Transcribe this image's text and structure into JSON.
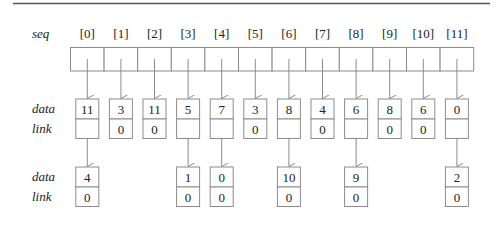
{
  "diagram": {
    "seq_label": "seq",
    "data_label": "data",
    "link_label": "link",
    "indices": [
      "[0]",
      "[1]",
      "[2]",
      "[3]",
      "[4]",
      "[5]",
      "[6]",
      "[7]",
      "[8]",
      "[9]",
      "[10]",
      "[11]"
    ],
    "first_nodes": [
      {
        "data": "11",
        "link": "",
        "has_next": true
      },
      {
        "data": "3",
        "link": "0",
        "has_next": false
      },
      {
        "data": "11",
        "link": "0",
        "has_next": false
      },
      {
        "data": "5",
        "link": "",
        "has_next": true
      },
      {
        "data": "7",
        "link": "",
        "has_next": true
      },
      {
        "data": "3",
        "link": "0",
        "has_next": false
      },
      {
        "data": "8",
        "link": "",
        "has_next": true
      },
      {
        "data": "4",
        "link": "0",
        "has_next": false
      },
      {
        "data": "6",
        "link": "",
        "has_next": true
      },
      {
        "data": "8",
        "link": "0",
        "has_next": false
      },
      {
        "data": "6",
        "link": "0",
        "has_next": false
      },
      {
        "data": "0",
        "link": "",
        "has_next": true
      }
    ],
    "second_nodes": [
      {
        "column": 0,
        "data": "4",
        "link": "0"
      },
      {
        "column": 3,
        "data": "1",
        "link": "0"
      },
      {
        "column": 4,
        "data": "0",
        "link": "0"
      },
      {
        "column": 6,
        "data": "10",
        "link": "0"
      },
      {
        "column": 8,
        "data": "9",
        "link": "0"
      },
      {
        "column": 11,
        "data": "2",
        "link": "0"
      }
    ],
    "colors": {
      "stroke": "#8c8c8c",
      "rule": "#555555",
      "text": "#222222"
    }
  }
}
